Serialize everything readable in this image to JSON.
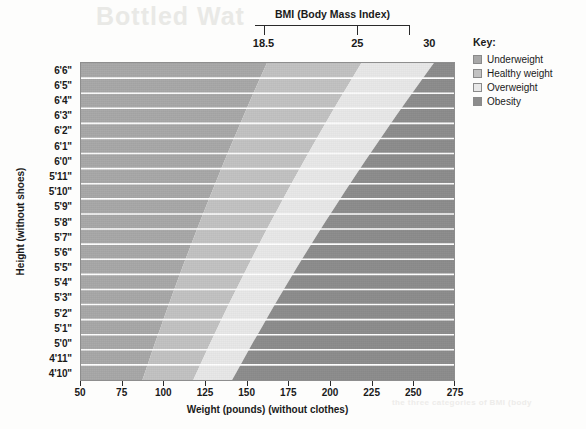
{
  "scan_artifacts": {
    "top_bleed": "Bottled Wat",
    "bottom_bleed": "the three categories of BMI (body"
  },
  "bmi_scale": {
    "title": "BMI (Body Mass Index)",
    "ticks": [
      {
        "label": "18.5",
        "value": 18.5
      },
      {
        "label": "25",
        "value": 25
      },
      {
        "label": "30",
        "value": 30
      }
    ]
  },
  "legend": {
    "title": "Key:",
    "items": [
      {
        "label": "Underweight",
        "color": "#a8a8a8"
      },
      {
        "label": "Healthy weight",
        "color": "#c2c2c2"
      },
      {
        "label": "Overweight",
        "color": "#e8e8e8"
      },
      {
        "label": "Obesity",
        "color": "#8c8c8c"
      }
    ]
  },
  "axes": {
    "x": {
      "title": "Weight (pounds) (without clothes)",
      "min": 50,
      "max": 275,
      "ticks": [
        50,
        75,
        100,
        125,
        150,
        175,
        200,
        225,
        250,
        275
      ],
      "tick_labels": [
        "50",
        "75",
        "100",
        "125",
        "150",
        "175",
        "200",
        "225",
        "250",
        "275"
      ]
    },
    "y": {
      "title": "Height (without shoes)",
      "tick_labels": [
        "6'6\"",
        "6'5\"",
        "6'4\"",
        "6'3\"",
        "6'2\"",
        "6'1\"",
        "6'0\"",
        "5'11\"",
        "5'10\"",
        "5'9\"",
        "5'8\"",
        "5'7\"",
        "5'6\"",
        "5'5\"",
        "5'4\"",
        "5'3\"",
        "5'2\"",
        "5'1\"",
        "5'0\"",
        "4'11\"",
        "4'10\""
      ],
      "heights_inches": [
        78,
        77,
        76,
        75,
        74,
        73,
        72,
        71,
        70,
        69,
        68,
        67,
        66,
        65,
        64,
        63,
        62,
        61,
        60,
        59,
        58
      ]
    }
  },
  "chart_data": {
    "type": "heatmap",
    "title": "BMI (Body Mass Index)",
    "xlabel": "Weight (pounds) (without clothes)",
    "ylabel": "Height (without shoes)",
    "xlim": [
      50,
      275
    ],
    "ylim_inches": [
      58,
      78
    ],
    "grid": true,
    "legend_position": "right",
    "bmi_formula": "BMI = 703 * pounds / inches^2",
    "bands": [
      {
        "name": "Underweight",
        "bmi_min": 0,
        "bmi_max": 18.5,
        "color": "#a8a8a8"
      },
      {
        "name": "Healthy weight",
        "bmi_min": 18.5,
        "bmi_max": 25,
        "color": "#c2c2c2"
      },
      {
        "name": "Overweight",
        "bmi_min": 25,
        "bmi_max": 30,
        "color": "#e8e8e8"
      },
      {
        "name": "Obesity",
        "bmi_min": 30,
        "bmi_max": 99,
        "color": "#8c8c8c"
      }
    ],
    "boundary_weights_by_height": [
      {
        "height": "6'6\"",
        "inches": 78,
        "bmi_18_5": 160.1,
        "bmi_25": 216.4,
        "bmi_30": 259.6
      },
      {
        "height": "6'5\"",
        "inches": 77,
        "bmi_18_5": 156.0,
        "bmi_25": 210.9,
        "bmi_30": 253.0
      },
      {
        "height": "6'4\"",
        "inches": 76,
        "bmi_18_5": 152.0,
        "bmi_25": 205.4,
        "bmi_30": 246.5
      },
      {
        "height": "6'3\"",
        "inches": 75,
        "bmi_18_5": 148.1,
        "bmi_25": 200.1,
        "bmi_30": 240.1
      },
      {
        "height": "6'2\"",
        "inches": 74,
        "bmi_18_5": 144.2,
        "bmi_25": 194.8,
        "bmi_30": 233.8
      },
      {
        "height": "6'1\"",
        "inches": 73,
        "bmi_18_5": 140.3,
        "bmi_25": 189.6,
        "bmi_30": 227.6
      },
      {
        "height": "6'0\"",
        "inches": 72,
        "bmi_18_5": 136.5,
        "bmi_25": 184.5,
        "bmi_30": 221.4
      },
      {
        "height": "5'11\"",
        "inches": 71,
        "bmi_18_5": 132.8,
        "bmi_25": 179.4,
        "bmi_30": 215.3
      },
      {
        "height": "5'10\"",
        "inches": 70,
        "bmi_18_5": 129.1,
        "bmi_25": 174.4,
        "bmi_30": 209.3
      },
      {
        "height": "5'9\"",
        "inches": 69,
        "bmi_18_5": 125.4,
        "bmi_25": 169.5,
        "bmi_30": 203.4
      },
      {
        "height": "5'8\"",
        "inches": 68,
        "bmi_18_5": 121.8,
        "bmi_25": 164.6,
        "bmi_30": 197.5
      },
      {
        "height": "5'7\"",
        "inches": 67,
        "bmi_18_5": 118.3,
        "bmi_25": 159.8,
        "bmi_30": 191.8
      },
      {
        "height": "5'6\"",
        "inches": 66,
        "bmi_18_5": 114.8,
        "bmi_25": 155.1,
        "bmi_30": 186.1
      },
      {
        "height": "5'5\"",
        "inches": 65,
        "bmi_18_5": 111.3,
        "bmi_25": 150.5,
        "bmi_30": 180.5
      },
      {
        "height": "5'4\"",
        "inches": 64,
        "bmi_18_5": 107.9,
        "bmi_25": 145.9,
        "bmi_30": 175.0
      },
      {
        "height": "5'3\"",
        "inches": 63,
        "bmi_18_5": 104.6,
        "bmi_25": 141.3,
        "bmi_30": 169.6
      },
      {
        "height": "5'2\"",
        "inches": 62,
        "bmi_18_5": 101.3,
        "bmi_25": 136.9,
        "bmi_30": 164.3
      },
      {
        "height": "5'1\"",
        "inches": 61,
        "bmi_18_5": 98.1,
        "bmi_25": 132.5,
        "bmi_30": 159.1
      },
      {
        "height": "5'0\"",
        "inches": 60,
        "bmi_18_5": 94.8,
        "bmi_25": 128.2,
        "bmi_30": 153.8
      },
      {
        "height": "4'11\"",
        "inches": 59,
        "bmi_18_5": 91.7,
        "bmi_25": 124.0,
        "bmi_30": 148.8
      },
      {
        "height": "4'10\"",
        "inches": 58,
        "bmi_18_5": 88.6,
        "bmi_25": 119.8,
        "bmi_30": 143.7
      }
    ]
  }
}
